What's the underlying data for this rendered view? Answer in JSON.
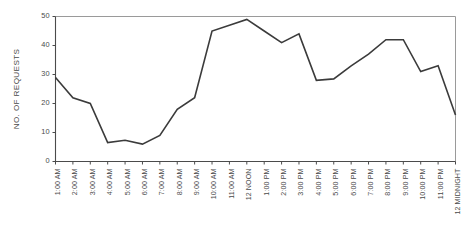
{
  "chart_data": {
    "type": "line",
    "title": "",
    "xlabel": "",
    "ylabel": "NO. OF REQUESTS",
    "ylim": [
      0,
      50
    ],
    "yticks": [
      0,
      10,
      20,
      30,
      40,
      50
    ],
    "grid": false,
    "legend": "none",
    "categories": [
      "1:00 AM",
      "2:00 AM",
      "3:00 AM",
      "4:00 AM",
      "5:00 AM",
      "6:00 AM",
      "7:00 AM",
      "8:00 AM",
      "9:00 AM",
      "10:00 AM",
      "11:00 AM",
      "12 NOON",
      "1:00 PM",
      "2:00 PM",
      "3:00 PM",
      "4:00 PM",
      "5:00 PM",
      "6:00 PM",
      "7:00 PM",
      "8:00 PM",
      "9:00 PM",
      "10:00 PM",
      "11:00 PM",
      "12 MIDNIGHT"
    ],
    "values": [
      29,
      22,
      20,
      6.5,
      7.3,
      6,
      9,
      18,
      22,
      45,
      47,
      49,
      45,
      41,
      44,
      28,
      28.5,
      33,
      37,
      42,
      42,
      31,
      33,
      16
    ],
    "series": [
      {
        "name": "No. of requests",
        "color": "#3b3b3b",
        "values": [
          29,
          22,
          20,
          6.5,
          7.3,
          6,
          9,
          18,
          22,
          45,
          47,
          49,
          45,
          41,
          44,
          28,
          28.5,
          33,
          37,
          42,
          42,
          31,
          33,
          16
        ]
      }
    ]
  },
  "axes": {
    "y_tick_labels": [
      "0",
      "10",
      "20",
      "30",
      "40",
      "50"
    ],
    "y_axis_title": "NO. OF REQUESTS",
    "x_tick_labels": [
      "1:00 AM",
      "2:00 AM",
      "3:00 AM",
      "4:00 AM",
      "5:00 AM",
      "6:00 AM",
      "7:00 AM",
      "8:00 AM",
      "9:00 AM",
      "10:00 AM",
      "11:00 AM",
      "12 NOON",
      "1:00 PM",
      "2:00 PM",
      "3:00 PM",
      "4:00 PM",
      "5:00 PM",
      "6:00 PM",
      "7:00 PM",
      "8:00 PM",
      "9:00 PM",
      "10:00 PM",
      "11:00 PM",
      "12 MIDNIGHT"
    ]
  },
  "colors": {
    "line": "#3b3b3b",
    "axis": "#4b4b4b",
    "frame": "#9a9a9a",
    "text": "#4a4a4a",
    "background": "#ffffff"
  }
}
